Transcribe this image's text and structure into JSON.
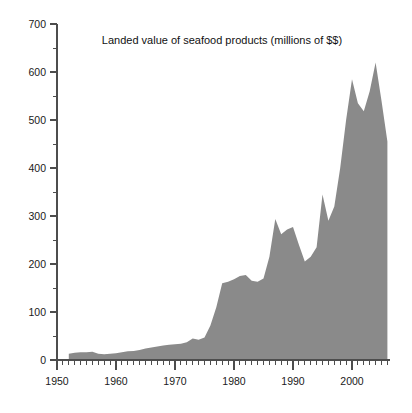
{
  "chart_data": {
    "type": "area",
    "title": "Landed value of seafood products (millions of $$)",
    "xlabel": "",
    "ylabel": "",
    "xlim": [
      1950,
      2007
    ],
    "ylim": [
      0,
      700
    ],
    "grid": false,
    "legend": "none",
    "y_ticks_major": [
      0,
      100,
      200,
      300,
      400,
      500,
      600,
      700
    ],
    "y_ticks_minor": [
      50,
      150,
      250,
      350,
      450,
      550,
      650
    ],
    "y_tick_labels": [
      "0",
      "100",
      "200",
      "300",
      "400",
      "500",
      "600",
      "700"
    ],
    "x_ticks_major": [
      1950,
      1960,
      1970,
      1980,
      1990,
      2000
    ],
    "x_tick_labels": [
      "1950",
      "1960",
      "1970",
      "1980",
      "1990",
      "2000"
    ],
    "x_minor_tick_interval": 1,
    "series_name": "Landed value",
    "fill_color": "#8a8a8a",
    "axis_color": "#4d4d4d",
    "x": [
      1952,
      1953,
      1954,
      1955,
      1956,
      1957,
      1958,
      1959,
      1960,
      1961,
      1962,
      1963,
      1964,
      1965,
      1966,
      1967,
      1968,
      1969,
      1970,
      1971,
      1972,
      1973,
      1974,
      1975,
      1976,
      1977,
      1978,
      1979,
      1980,
      1981,
      1982,
      1983,
      1984,
      1985,
      1986,
      1987,
      1988,
      1989,
      1990,
      1991,
      1992,
      1993,
      1994,
      1995,
      1996,
      1997,
      1998,
      1999,
      2000,
      2001,
      2002,
      2003,
      2004,
      2005,
      2006
    ],
    "values": [
      13,
      15,
      16,
      16,
      17,
      13,
      12,
      13,
      14,
      16,
      18,
      19,
      21,
      24,
      26,
      28,
      30,
      32,
      33,
      34,
      37,
      45,
      42,
      47,
      72,
      110,
      160,
      163,
      168,
      175,
      177,
      165,
      163,
      170,
      215,
      294,
      262,
      272,
      277,
      240,
      205,
      215,
      235,
      345,
      290,
      320,
      400,
      500,
      585,
      535,
      518,
      560,
      620,
      540,
      455
    ]
  }
}
